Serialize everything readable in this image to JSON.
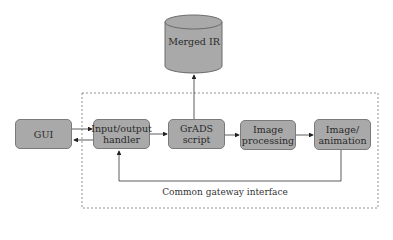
{
  "diagram": {
    "database": {
      "label": "Merged IR"
    },
    "nodes": [
      {
        "id": "gui",
        "label": "GUI"
      },
      {
        "id": "io_handler",
        "label": "Input/output\nhandler"
      },
      {
        "id": "grads_script",
        "label": "GrADS script"
      },
      {
        "id": "image_processing",
        "label": "Image\nprocessing"
      },
      {
        "id": "image_animation",
        "label": "Image/\nanimation"
      }
    ],
    "group": {
      "label": "Common gateway interface"
    },
    "edges": [
      {
        "from": "gui",
        "to": "io_handler"
      },
      {
        "from": "io_handler",
        "to": "gui"
      },
      {
        "from": "io_handler",
        "to": "grads_script"
      },
      {
        "from": "grads_script",
        "to": "database"
      },
      {
        "from": "grads_script",
        "to": "image_processing"
      },
      {
        "from": "image_processing",
        "to": "image_animation"
      },
      {
        "from": "image_animation",
        "to": "io_handler"
      }
    ],
    "colors": {
      "node_fill": "#a9a9a9",
      "node_border": "#7a7a7a",
      "line": "#333333"
    }
  }
}
